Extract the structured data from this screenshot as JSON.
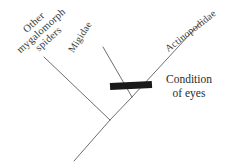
{
  "figure": {
    "type": "cladogram",
    "background_color": "#ffffff",
    "line_color": "#6e6e6e",
    "text_color": "#3a3a3a",
    "marker_color": "#1a1a1a"
  },
  "taxa": [
    {
      "id": "other-mygalomorph-spiders",
      "lines": [
        "Other",
        "mygalomorph",
        "spiders"
      ],
      "full_text": "Other mygalomorph spiders",
      "rotation_deg": -42
    },
    {
      "id": "migidae",
      "label": "Migidae",
      "rotation_deg": -57
    },
    {
      "id": "actinopodidae",
      "label": "Actinopodidae",
      "rotation_deg": -38
    }
  ],
  "character_marker": {
    "id": "condition-of-eyes",
    "lines": [
      "Condition",
      "of eyes"
    ],
    "full_text": "Condition of eyes",
    "color": "#1a1a1a"
  },
  "branches": {
    "root_stem": {
      "x1": 74,
      "y1": 161,
      "x2": 110,
      "y2": 120
    },
    "left_branch": {
      "x1": 110,
      "y1": 120,
      "x2": 44,
      "y2": 57
    },
    "right_branch": {
      "x1": 110,
      "y1": 120,
      "x2": 132,
      "y2": 97
    },
    "migidae_branch": {
      "x1": 132,
      "y1": 97,
      "x2": 103,
      "y2": 47
    },
    "actinopodidae_branch": {
      "x1": 132,
      "y1": 97,
      "x2": 202,
      "y2": 21
    }
  },
  "marker_bar": {
    "x": 110,
    "y": 82,
    "width": 42,
    "height": 7,
    "rotation_deg": -3
  }
}
